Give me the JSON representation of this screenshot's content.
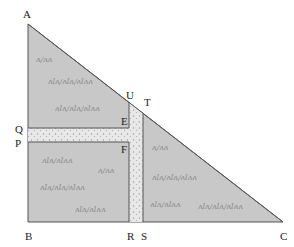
{
  "diagram": {
    "type": "geometry-figure",
    "colors": {
      "field": "#c9c9c9",
      "path": "#e6e6e6",
      "outline": "#444444",
      "label": "#222222"
    },
    "points": {
      "A": {
        "label": "A",
        "x": 28,
        "y": 24
      },
      "B": {
        "label": "B",
        "x": 28,
        "y": 222
      },
      "C": {
        "label": "C",
        "x": 283,
        "y": 222
      },
      "Q": {
        "label": "Q",
        "x": 28,
        "y": 128
      },
      "P": {
        "label": "P",
        "x": 28,
        "y": 142
      },
      "U": {
        "label": "U",
        "x": 129,
        "y": 102
      },
      "T": {
        "label": "T",
        "x": 143,
        "y": 113
      },
      "E": {
        "label": "E",
        "x": 129,
        "y": 128
      },
      "F": {
        "label": "F",
        "x": 129,
        "y": 142
      },
      "R": {
        "label": "R",
        "x": 129,
        "y": 222
      },
      "S": {
        "label": "S",
        "x": 143,
        "y": 222
      }
    },
    "labels": {
      "A": "A",
      "B": "B",
      "C": "C",
      "Q": "Q",
      "P": "P",
      "U": "U",
      "T": "T",
      "E": "E",
      "F": "F",
      "R": "R",
      "S": "S"
    },
    "grass_marks": [
      "ʌlʌ/ʌ",
      "ʌlʌ/ʌlʌ/ʌlʌʌ",
      "ʌlʌ/ʌlʌʌ",
      "ʌ/ʌʌ"
    ]
  }
}
